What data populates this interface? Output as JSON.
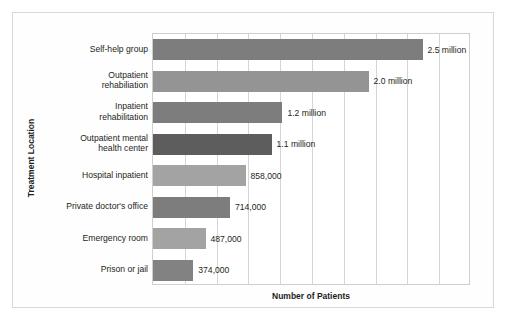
{
  "chart_data": {
    "type": "bar",
    "orientation": "horizontal",
    "title": "",
    "xlabel": "Number of Patients",
    "ylabel": "Treatment Location",
    "categories": [
      "Self-help group",
      "Outpatient rehabiliation",
      "Inpatient rehabilitation",
      "Outpatient mental health center",
      "Hospital inpatient",
      "Private doctor's office",
      "Emergency room",
      "Prison or jail"
    ],
    "category_lines": [
      [
        "Self-help group"
      ],
      [
        "Outpatient",
        "rehabiliation"
      ],
      [
        "Inpatient",
        "rehabilitation"
      ],
      [
        "Outpatient mental",
        "health center"
      ],
      [
        "Hospital inpatient"
      ],
      [
        "Private doctor's office"
      ],
      [
        "Emergency room"
      ],
      [
        "Prison or jail"
      ]
    ],
    "values": [
      2500000,
      2000000,
      1200000,
      1100000,
      858000,
      714000,
      487000,
      374000
    ],
    "data_labels": [
      "2.5 million",
      "2.0 million",
      "1.2 million",
      "1.1 million",
      "858,000",
      "714,000",
      "487,000",
      "374,000"
    ],
    "bar_colors": [
      "#7d7d7d",
      "#949494",
      "#7d7d7d",
      "#5d5d5d",
      "#a3a3a3",
      "#7d7d7d",
      "#a3a3a3",
      "#828282"
    ],
    "xlim": [
      0,
      2950000
    ],
    "gridlines": [
      0.1,
      0.2,
      0.3,
      0.4,
      0.5,
      0.6,
      0.7,
      0.8,
      0.9
    ],
    "grid": true,
    "legend": null,
    "axis_tick_labels": []
  },
  "figure": {
    "frame_color": "#d8d8d8",
    "plot_border_color": "#cfcfcf",
    "grid_color": "#d5d5d5",
    "text_color": "#231f20",
    "background": "#ffffff"
  }
}
